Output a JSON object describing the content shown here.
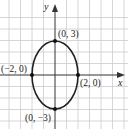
{
  "chart_data": {
    "type": "scatter",
    "title": "",
    "xlabel": "x",
    "ylabel": "y",
    "grid": true,
    "xlim": [
      -4.5,
      6
    ],
    "ylim": [
      -4.5,
      6
    ],
    "curve": {
      "shape": "ellipse",
      "center": [
        0,
        0
      ],
      "semi_axis_x": 2,
      "semi_axis_y": 3,
      "equation": "x^2/4 + y^2/9 = 1"
    },
    "points": [
      {
        "x": 0,
        "y": 3,
        "label": "(0, 3)"
      },
      {
        "x": 2,
        "y": 0,
        "label": "(2, 0)"
      },
      {
        "x": -2,
        "y": 0,
        "label": "(−2, 0)"
      },
      {
        "x": 0,
        "y": -3,
        "label": "(0, −3)"
      }
    ]
  },
  "axes": {
    "x_label": "x",
    "y_label": "y"
  },
  "labels": {
    "top": "(0, 3)",
    "right": "(2, 0)",
    "left": "(−2, 0)",
    "bottom": "(0, −3)"
  },
  "colors": {
    "grid": "#cccccc",
    "axis": "#333333",
    "curve": "#222222",
    "point": "#111111"
  }
}
